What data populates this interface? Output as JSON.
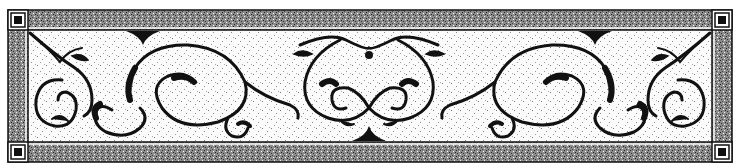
{
  "artwork": {
    "kind": "ornamental-border",
    "style": "stippled engraving",
    "colors": {
      "ink": "#111111",
      "paper": "#ffffff",
      "band_stipple": "#555555",
      "panel_stipple": "#9a9a9a"
    },
    "frame": {
      "x": 8,
      "y": 10,
      "width": 724,
      "height": 152,
      "band": 20
    },
    "corners": [
      "top-left",
      "top-right",
      "bottom-left",
      "bottom-right"
    ],
    "motifs": [
      "left-half-palmette",
      "left-large-scroll",
      "center-heart-palmette",
      "right-large-scroll",
      "right-half-palmette"
    ]
  }
}
